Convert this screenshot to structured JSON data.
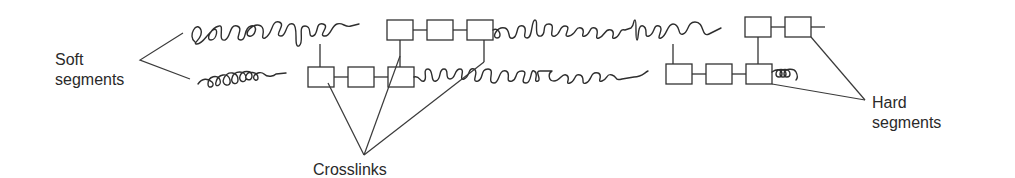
{
  "diagram": {
    "type": "segmented polymer chain schematic",
    "labels": {
      "soft": {
        "line1": "Soft",
        "line2": "segments"
      },
      "hard": {
        "line1": "Hard",
        "line2": "segments"
      },
      "crosslinks": "Crosslinks"
    },
    "chains": [
      {
        "name": "top-chain",
        "sequence": [
          "soft-coil",
          "hard-block(3 boxes)",
          "soft-coil",
          "hard-block(2 boxes)"
        ]
      },
      {
        "name": "bottom-chain",
        "sequence": [
          "soft-coil",
          "hard-block(3 boxes)",
          "soft-coil",
          "hard-block(3 boxes)",
          "soft-coil"
        ]
      }
    ],
    "colors": {
      "stroke": "#333333",
      "background": "#ffffff",
      "text": "#2a2a2a"
    }
  }
}
